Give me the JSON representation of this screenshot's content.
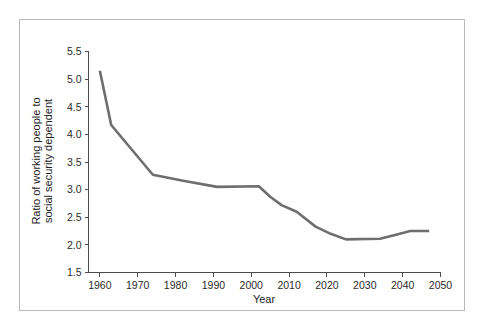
{
  "chart_data": {
    "type": "line",
    "title": "",
    "xlabel": "Year",
    "ylabel": "Ratio of working people to social security dependent",
    "ylabel_lines": [
      "Ratio of working people to",
      "social security dependent"
    ],
    "xlim": [
      1957,
      2050
    ],
    "ylim": [
      1.5,
      5.5
    ],
    "xticks": [
      1960,
      1970,
      1980,
      1990,
      2000,
      2010,
      2020,
      2030,
      2040,
      2050
    ],
    "xtick_labels": [
      "1960",
      "1970",
      "1980",
      "1990",
      "2000",
      "2010",
      "2020",
      "2030",
      "2040",
      "2050"
    ],
    "yticks": [
      1.5,
      2.0,
      2.5,
      3.0,
      3.5,
      4.0,
      4.5,
      5.0,
      5.5
    ],
    "ytick_labels": [
      "1.5",
      "2.0",
      "2.5",
      "3.0",
      "3.5",
      "4.0",
      "4.5",
      "5.0",
      "5.5"
    ],
    "grid": false,
    "legend": false,
    "legend_position": "none",
    "line_color": "#6e6e6e",
    "axis_color": "#4d4d4d",
    "border_color": "#b9b9b9",
    "background_color": "#ffffff",
    "series": [
      {
        "name": "Ratio of working people to social security dependent",
        "x": [
          1960,
          1963,
          1974,
          1982,
          1991,
          2002,
          2005,
          2008,
          2012,
          2017,
          2021,
          2025,
          2034,
          2038,
          2042,
          2047
        ],
        "values": [
          5.15,
          4.17,
          3.27,
          3.16,
          3.05,
          3.06,
          2.87,
          2.72,
          2.6,
          2.33,
          2.2,
          2.1,
          2.11,
          2.18,
          2.25,
          2.25
        ]
      }
    ]
  },
  "axes": {
    "x_title": "Year",
    "y_title_line1": "Ratio of working people to",
    "y_title_line2": "social security dependent"
  }
}
